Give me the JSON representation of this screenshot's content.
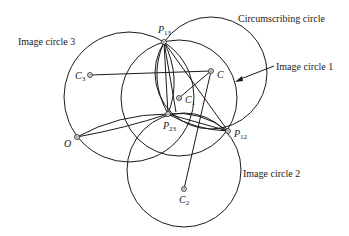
{
  "diagram": {
    "labels": {
      "circumscribing": "Circumscribing circle",
      "image1": "Image circle 1",
      "image2": "Image circle 2",
      "image3": "Image circle 3"
    },
    "points": {
      "P13": {
        "main": "P",
        "sub": "13"
      },
      "P23": {
        "main": "P",
        "sub": "23"
      },
      "P12": {
        "main": "P",
        "sub": "12"
      },
      "O": {
        "main": "O",
        "sub": ""
      },
      "C": {
        "main": "C",
        "sub": ""
      },
      "C1": {
        "main": "C",
        "sub": "1"
      },
      "C2": {
        "main": "C",
        "sub": "2"
      },
      "C3": {
        "main": "C",
        "sub": "3"
      }
    },
    "colors": {
      "stroke": "#1a1a1a",
      "background": "#ffffff"
    }
  }
}
